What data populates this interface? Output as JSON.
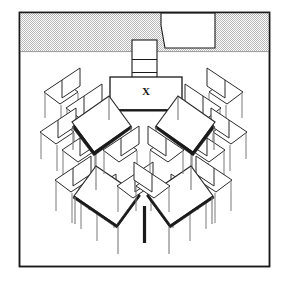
{
  "diagram": {
    "kind": "axonometric floor-plan line drawing",
    "canvas": {
      "width": 287,
      "height": 288,
      "background": "#ffffff"
    },
    "frame": {
      "name": "room-boundary",
      "x": 19,
      "y": 12,
      "width": 251,
      "height": 255,
      "stroke": "#1a1a1a",
      "stroke_width": 1.4,
      "fill": "#ffffff"
    },
    "wall_band": {
      "name": "front-wall",
      "x": 20,
      "y": 13,
      "width": 249,
      "height": 39,
      "fill": "#d2d2d2",
      "pattern": "stipple-checker",
      "note": "hatched grey band across the top of the room"
    },
    "door_opening": {
      "name": "door-opening",
      "fill": "#ffffff",
      "stroke": "#1a1a1a",
      "points": "161,13 215,13 215,48 165,48 161,26",
      "note": "white trapezoidal cut-out in the front wall"
    },
    "board": {
      "name": "whiteboard-panel",
      "x": 132,
      "y": 40,
      "width": 25,
      "height": 38,
      "divider_y": 60,
      "fill": "#ffffff",
      "stroke": "#1a1a1a",
      "note": "two-cell narrow panel standing against the wall"
    },
    "instructor_table": {
      "name": "instructor-table",
      "x": 110,
      "y": 77,
      "width": 72,
      "height": 33,
      "fill": "#ffffff",
      "stroke": "#1a1a1a",
      "marker": "X",
      "marker_x": 146,
      "marker_y": 95,
      "note": "front desk marked with an X"
    },
    "floor_vertex": {
      "name": "center-table-leg",
      "x": 145,
      "y_top": 206,
      "y_bottom": 243,
      "stroke": "#1a1a1a",
      "stroke_width": 3.2
    },
    "colors": {
      "ink": "#1a1a1a",
      "line": "#2b2b2b",
      "thin": "#7a7a7a",
      "wall_grey": "#d2d2d2",
      "paper": "#ffffff"
    },
    "legend": {
      "x_marker_label": "X",
      "x_marker_meaning": "instructor position"
    },
    "counts": {
      "tables": 5,
      "chairs": 16,
      "wings": 2
    }
  }
}
